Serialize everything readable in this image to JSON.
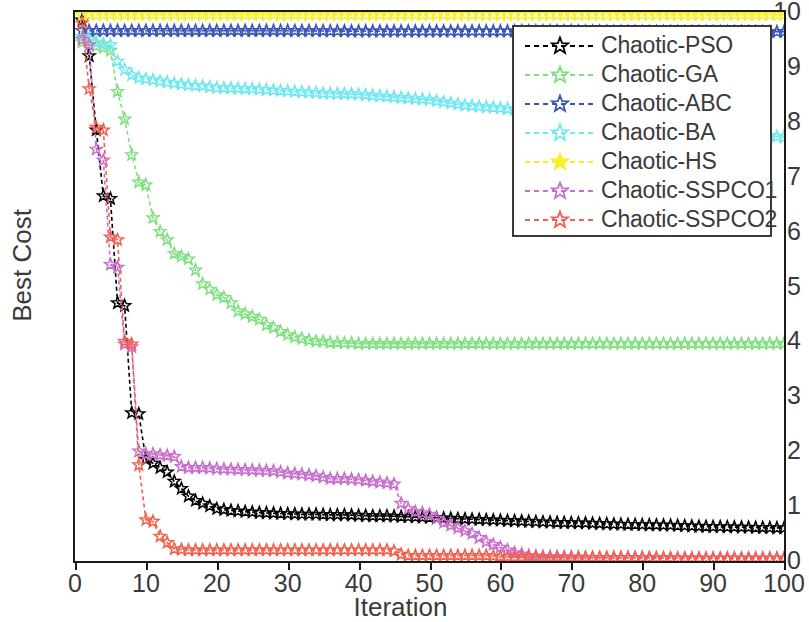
{
  "chart_data": {
    "type": "line",
    "title": "",
    "xlabel": "Iteration",
    "ylabel": "Best Cost",
    "xlim": [
      0,
      100
    ],
    "ylim": [
      0,
      10
    ],
    "xticks": [
      0,
      10,
      20,
      30,
      40,
      50,
      60,
      70,
      80,
      90,
      100
    ],
    "yticks": [
      0,
      1,
      2,
      3,
      4,
      5,
      6,
      7,
      8,
      9,
      10
    ],
    "grid": false,
    "legend_position": "upper right",
    "marker": "star",
    "linestyle": "dashed",
    "series": [
      {
        "name": "Chaotic-PSO",
        "color": "#000000",
        "x": [
          1,
          2,
          3,
          4,
          5,
          6,
          7,
          8,
          9,
          10,
          11,
          12,
          13,
          14,
          15,
          16,
          17,
          18,
          19,
          20,
          22,
          24,
          26,
          28,
          30,
          32,
          34,
          36,
          38,
          40,
          42,
          44,
          46,
          48,
          50,
          52,
          54,
          56,
          58,
          60,
          64,
          68,
          72,
          76,
          80,
          84,
          88,
          92,
          96,
          100
        ],
        "values": [
          9.85,
          9.2,
          7.85,
          6.65,
          6.6,
          4.7,
          4.65,
          2.7,
          2.68,
          1.85,
          1.78,
          1.7,
          1.62,
          1.45,
          1.32,
          1.18,
          1.1,
          1.05,
          1.0,
          0.95,
          0.92,
          0.9,
          0.88,
          0.87,
          0.86,
          0.85,
          0.85,
          0.84,
          0.84,
          0.83,
          0.82,
          0.82,
          0.81,
          0.8,
          0.79,
          0.78,
          0.77,
          0.76,
          0.75,
          0.74,
          0.72,
          0.7,
          0.69,
          0.67,
          0.66,
          0.65,
          0.63,
          0.62,
          0.61,
          0.6
        ]
      },
      {
        "name": "Chaotic-GA",
        "color": "#7fe07f",
        "x": [
          1,
          2,
          3,
          4,
          5,
          6,
          7,
          8,
          9,
          10,
          11,
          12,
          13,
          14,
          15,
          16,
          17,
          18,
          19,
          20,
          21,
          22,
          23,
          24,
          25,
          26,
          27,
          28,
          29,
          30,
          31,
          32,
          33,
          34,
          35,
          36,
          37,
          38,
          39,
          40,
          45,
          50,
          55,
          60,
          65,
          70,
          75,
          80,
          85,
          90,
          95,
          100
        ],
        "values": [
          9.45,
          9.4,
          9.38,
          9.35,
          9.3,
          8.55,
          8.05,
          7.4,
          6.9,
          6.85,
          6.25,
          6.0,
          5.85,
          5.6,
          5.55,
          5.5,
          5.3,
          5.05,
          4.95,
          4.85,
          4.8,
          4.7,
          4.55,
          4.5,
          4.45,
          4.4,
          4.3,
          4.25,
          4.18,
          4.12,
          4.08,
          4.05,
          4.02,
          4.0,
          4.0,
          3.98,
          3.98,
          3.97,
          3.97,
          3.96,
          3.96,
          3.96,
          3.96,
          3.96,
          3.96,
          3.96,
          3.96,
          3.96,
          3.96,
          3.96,
          3.96,
          3.96
        ]
      },
      {
        "name": "Chaotic-ABC",
        "color": "#3a53b5",
        "x": [
          1,
          10,
          20,
          30,
          40,
          50,
          60,
          70,
          80,
          90,
          100
        ],
        "values": [
          9.66,
          9.66,
          9.66,
          9.66,
          9.65,
          9.65,
          9.65,
          9.65,
          9.64,
          9.64,
          9.64
        ]
      },
      {
        "name": "Chaotic-BA",
        "color": "#6fe8f2",
        "x": [
          1,
          2,
          3,
          4,
          5,
          6,
          7,
          8,
          9,
          10,
          12,
          14,
          16,
          18,
          20,
          25,
          30,
          35,
          40,
          45,
          50,
          55,
          60,
          70,
          80,
          90,
          100
        ],
        "values": [
          9.55,
          9.5,
          9.45,
          9.42,
          9.4,
          9.1,
          8.95,
          8.85,
          8.8,
          8.78,
          8.74,
          8.7,
          8.67,
          8.65,
          8.62,
          8.6,
          8.56,
          8.52,
          8.5,
          8.45,
          8.4,
          8.3,
          8.25,
          8.1,
          7.95,
          7.85,
          7.72
        ]
      },
      {
        "name": "Chaotic-HS",
        "color": "#f5f02a",
        "x": [
          1,
          10,
          20,
          30,
          40,
          50,
          60,
          70,
          80,
          90,
          100
        ],
        "values": [
          9.95,
          9.95,
          9.95,
          9.95,
          9.95,
          9.95,
          9.95,
          9.95,
          9.95,
          9.95,
          9.95
        ]
      },
      {
        "name": "Chaotic-SSPCO1",
        "color": "#c86ecd",
        "x": [
          1,
          2,
          3,
          4,
          5,
          6,
          7,
          8,
          9,
          10,
          11,
          12,
          13,
          14,
          15,
          16,
          18,
          20,
          22,
          24,
          26,
          28,
          30,
          32,
          34,
          36,
          38,
          40,
          42,
          44,
          45,
          46,
          47,
          48,
          50,
          52,
          54,
          56,
          58,
          60,
          62,
          64,
          66,
          70,
          75,
          80,
          85,
          90,
          95,
          100
        ],
        "values": [
          9.5,
          9.4,
          7.5,
          7.3,
          5.4,
          5.35,
          3.95,
          3.9,
          2.0,
          1.95,
          1.95,
          1.93,
          1.92,
          1.9,
          1.72,
          1.7,
          1.7,
          1.68,
          1.67,
          1.66,
          1.65,
          1.64,
          1.6,
          1.58,
          1.55,
          1.5,
          1.5,
          1.48,
          1.45,
          1.42,
          1.4,
          1.05,
          0.95,
          0.9,
          0.85,
          0.7,
          0.6,
          0.5,
          0.35,
          0.25,
          0.15,
          0.1,
          0.08,
          0.07,
          0.06,
          0.06,
          0.05,
          0.05,
          0.05,
          0.05
        ]
      },
      {
        "name": "Chaotic-SSPCO2",
        "color": "#f4604d",
        "x": [
          1,
          2,
          3,
          4,
          5,
          6,
          7,
          8,
          9,
          10,
          11,
          12,
          14,
          16,
          18,
          20,
          24,
          28,
          32,
          36,
          40,
          44,
          45,
          46,
          47,
          48,
          50,
          52,
          54,
          56,
          58,
          60,
          62,
          64,
          66,
          70,
          75,
          80,
          85,
          90,
          95,
          100
        ],
        "values": [
          9.8,
          8.6,
          7.9,
          7.85,
          5.9,
          5.85,
          4.0,
          3.95,
          1.75,
          0.75,
          0.72,
          0.45,
          0.22,
          0.2,
          0.2,
          0.2,
          0.2,
          0.2,
          0.2,
          0.2,
          0.2,
          0.2,
          0.18,
          0.12,
          0.1,
          0.1,
          0.1,
          0.1,
          0.1,
          0.1,
          0.1,
          0.08,
          0.07,
          0.07,
          0.06,
          0.06,
          0.06,
          0.06,
          0.05,
          0.05,
          0.05,
          0.05
        ]
      }
    ]
  },
  "legend": {
    "items": [
      {
        "label": "Chaotic-PSO",
        "color": "#000000"
      },
      {
        "label": "Chaotic-GA",
        "color": "#7fe07f"
      },
      {
        "label": "Chaotic-ABC",
        "color": "#3a53b5"
      },
      {
        "label": "Chaotic-BA",
        "color": "#6fe8f2"
      },
      {
        "label": "Chaotic-HS",
        "color": "#f5f02a"
      },
      {
        "label": "Chaotic-SSPCO1",
        "color": "#c86ecd"
      },
      {
        "label": "Chaotic-SSPCO2",
        "color": "#f4604d"
      }
    ]
  },
  "axes": {
    "x_title": "Iteration",
    "y_title": "Best Cost",
    "x_tick_labels": [
      "0",
      "10",
      "20",
      "30",
      "40",
      "50",
      "60",
      "70",
      "80",
      "90",
      "100"
    ],
    "y_tick_labels": [
      "0",
      "1",
      "2",
      "3",
      "4",
      "5",
      "6",
      "7",
      "8",
      "9",
      "10"
    ]
  }
}
